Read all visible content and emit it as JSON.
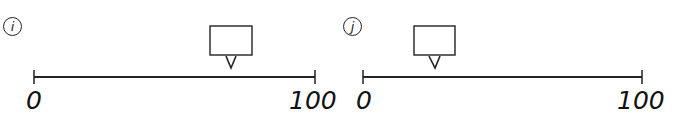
{
  "panels": [
    {
      "label": "i",
      "min_label": "0",
      "max_label": "100",
      "marker_value": 70,
      "box_text": ""
    },
    {
      "label": "j",
      "min_label": "0",
      "max_label": "100",
      "marker_value": 25,
      "box_text": ""
    }
  ],
  "colors": {
    "stroke": "#222222",
    "background": "#ffffff"
  }
}
